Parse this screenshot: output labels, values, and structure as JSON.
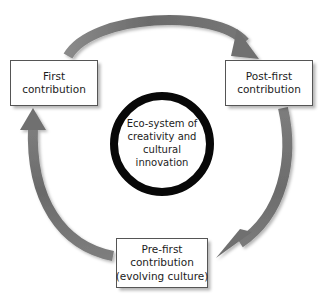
{
  "diagram": {
    "background_color": "#ffffff",
    "arrow_color": "#6f6f6f",
    "ring_color": "#080808",
    "box_border_color": "#555555",
    "text_color": "#1c1c1c",
    "center": {
      "label_lines": [
        "Eco-system of",
        "creativity and",
        "cultural",
        "innovation"
      ]
    },
    "nodes": [
      {
        "id": "first-contribution",
        "label_lines": [
          "First",
          "contribution"
        ]
      },
      {
        "id": "post-first-contribution",
        "label_lines": [
          "Post-first",
          "contribution"
        ]
      },
      {
        "id": "pre-first-contribution",
        "label_lines": [
          "Pre-first",
          "contribution",
          "(evolving culture)"
        ]
      }
    ],
    "arrows": [
      {
        "id": "arrow-first-to-postfirst",
        "from": "first-contribution",
        "to": "post-first-contribution",
        "direction": "clockwise-top"
      },
      {
        "id": "arrow-postfirst-to-prefirst",
        "from": "post-first-contribution",
        "to": "pre-first-contribution",
        "direction": "clockwise-right"
      },
      {
        "id": "arrow-prefirst-to-first",
        "from": "pre-first-contribution",
        "to": "first-contribution",
        "direction": "clockwise-left"
      }
    ]
  }
}
